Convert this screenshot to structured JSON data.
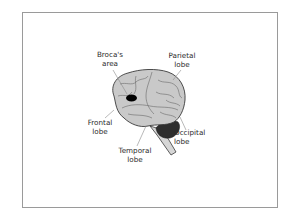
{
  "diagram": {
    "title": "",
    "labels": [
      {
        "id": "broca",
        "lines": [
          "Broca's",
          "area"
        ]
      },
      {
        "id": "parietal",
        "lines": [
          "Parietal",
          "lobe"
        ]
      },
      {
        "id": "frontal",
        "lines": [
          "Frontal",
          "lobe"
        ]
      },
      {
        "id": "temporal",
        "lines": [
          "Temporal",
          "lobe"
        ]
      },
      {
        "id": "occipital",
        "lines": [
          "Occipital",
          "lobe"
        ]
      }
    ],
    "highlighted_region": "broca",
    "colors": {
      "cortex_fill": "#c9c9c9",
      "outline": "#3a3a3a",
      "gyri_lines": "#6a6a6a",
      "broca_area": "#000000",
      "cerebellum": "#2e2e2e",
      "brainstem": "#d6d6d6",
      "frame_border": "#9a9a9a",
      "leader_lines": "#8a8a8a"
    }
  }
}
